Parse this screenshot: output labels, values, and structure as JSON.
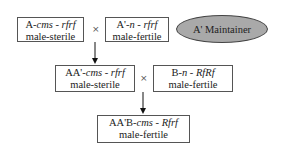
{
  "diagram": {
    "cross_symbol": "×",
    "row1": {
      "female": {
        "prefix": "A-",
        "cytoplasm": "cms",
        "sep": " - ",
        "genotype": "rfrf",
        "phenotype": "male-sterile"
      },
      "male": {
        "prefix": "A'-",
        "cytoplasm": "n",
        "sep": " - ",
        "genotype": "rfrf",
        "phenotype": "male-fertile"
      },
      "label": "A' Maintainer"
    },
    "row2": {
      "female": {
        "prefix": "AA'-",
        "cytoplasm": "cms",
        "sep": " - ",
        "genotype": "rfrf",
        "phenotype": "male-sterile"
      },
      "male": {
        "prefix": "B-",
        "cytoplasm": "n",
        "sep": " - ",
        "genotype": "RfRf",
        "phenotype": "male-fertile"
      }
    },
    "row3": {
      "offspring": {
        "prefix": "AA'B-",
        "cytoplasm": "cms",
        "sep": " - ",
        "genotype": "Rfrf",
        "phenotype": "male-fertile"
      }
    },
    "colors": {
      "ellipse_fill": "#a9a9a9",
      "border": "#555555",
      "arrow": "#111111"
    }
  }
}
